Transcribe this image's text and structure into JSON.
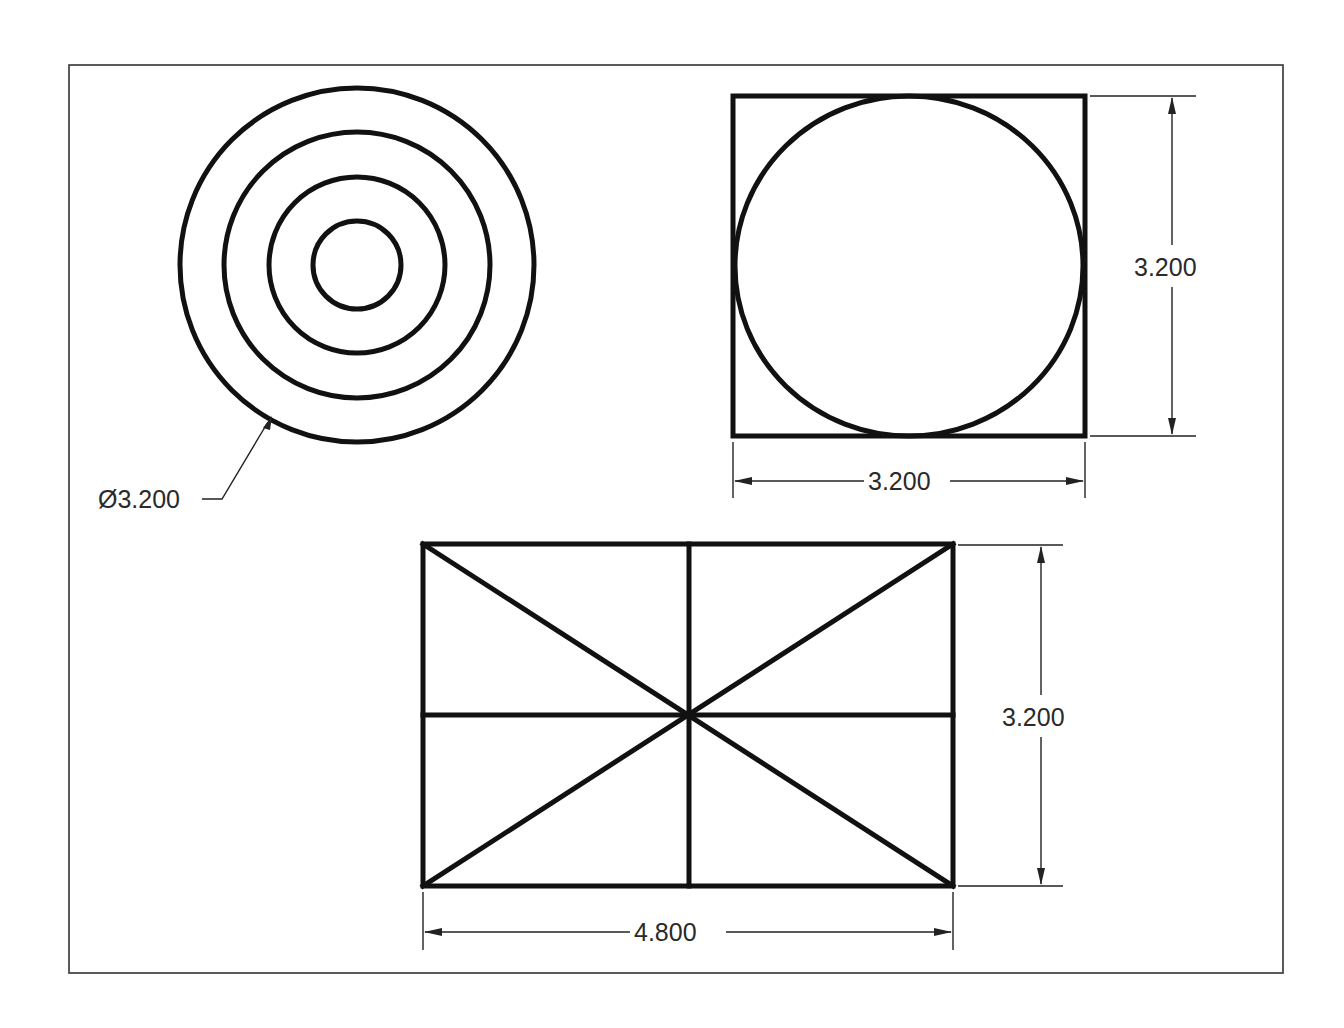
{
  "sheet": {
    "border": {
      "x": 69,
      "y": 65,
      "width": 1214,
      "height": 908
    },
    "colors": {
      "line": "#111111",
      "dimension": "#222222",
      "background": "#ffffff"
    }
  },
  "views": {
    "top_view": {
      "name": "Concentric circles view",
      "center": [
        357,
        265
      ],
      "radii_px": [
        178,
        135,
        89,
        45
      ],
      "dimension": {
        "label": "Ø3.200",
        "type": "diameter-leader"
      }
    },
    "side_view": {
      "name": "Square with inscribed circle",
      "rect": {
        "x": 733,
        "y": 96,
        "width": 352,
        "height": 340
      },
      "circle": {
        "center": [
          909,
          266
        ],
        "r": 173
      },
      "dimensions": {
        "height_label": "3.200",
        "width_label": "3.200"
      }
    },
    "front_view": {
      "name": "Rectangle with center lines and diagonals",
      "rect": {
        "x": 423,
        "y": 544,
        "width": 530,
        "height": 342
      },
      "dimensions": {
        "height_label": "3.200",
        "width_label": "4.800"
      }
    }
  }
}
